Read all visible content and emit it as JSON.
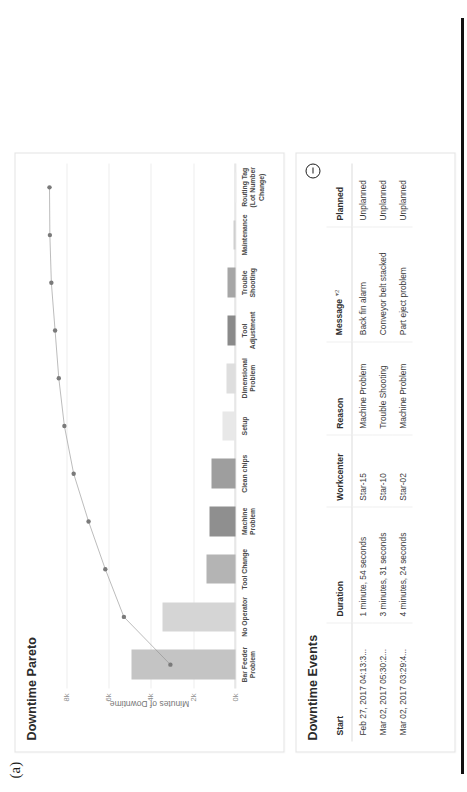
{
  "figure": {
    "label": "(a)"
  },
  "chart_card": {
    "title": "Downtime Pareto"
  },
  "table_card": {
    "title": "Downtime Events",
    "help_icon": "minus-circle-icon",
    "columns": [
      {
        "label": "Start"
      },
      {
        "label": "Duration"
      },
      {
        "label": "Workcenter"
      },
      {
        "label": "Reason"
      },
      {
        "label": "Message",
        "sort": "▾2"
      },
      {
        "label": "Planned"
      }
    ],
    "rows": [
      {
        "start": "Feb 27, 2017 04:13:3...",
        "duration": "1 minute, 54 seconds",
        "workcenter": "Star-15",
        "reason": "Machine Problem",
        "message": "Back fin alarm",
        "planned": "Unplanned"
      },
      {
        "start": "Mar 02, 2017 05:30:2...",
        "duration": "3 minutes, 31 seconds",
        "workcenter": "Star-10",
        "reason": "Trouble Shooting",
        "message": "Conveyor belt stacked",
        "planned": "Unplanned"
      },
      {
        "start": "Mar 02, 2017 03:29:4...",
        "duration": "4 minutes, 24 seconds",
        "workcenter": "Star-02",
        "reason": "Machine Problem",
        "message": "Part eject problem",
        "planned": "Unplanned"
      }
    ]
  },
  "chart_data": {
    "type": "bar",
    "title": "Downtime Pareto",
    "xlabel": "",
    "ylabel": "Minutes of Downtime",
    "ylim": [
      0,
      8800
    ],
    "yticks": [
      0,
      2000,
      4000,
      6000,
      8000
    ],
    "ytick_labels": [
      "0k",
      "2k",
      "4k",
      "6k",
      "8k"
    ],
    "grid": true,
    "legend": "none",
    "categories": [
      "Bar Feeder Problem",
      "No Operator",
      "Tool Change",
      "Machine Problem",
      "Clean chips",
      "Setup",
      "Dimensional Problem",
      "Tool Adjustment",
      "Trouble Shooting",
      "Maintenance",
      "Routing Tag (Lot Number Change)"
    ],
    "values": [
      4900,
      3450,
      1350,
      1250,
      1150,
      620,
      430,
      400,
      390,
      90,
      15
    ],
    "bar_colors": [
      "#c4c4c4",
      "#d5d5d5",
      "#b4b4b4",
      "#8f8f8f",
      "#9e9e9e",
      "#e8e8e8",
      "#dedede",
      "#8a8a8a",
      "#a6a6a6",
      "#cfcfcf",
      "#f0f0f0"
    ],
    "cumulative_percent": [
      35,
      60,
      70,
      79,
      87,
      92,
      95,
      97,
      99,
      99.8,
      100
    ],
    "cumulative_line_color": "#8e8e8e",
    "cumulative_marker_color": "#7a7a7a",
    "gridline_color": "#ededed",
    "axis_color": "#d8d8d8"
  }
}
